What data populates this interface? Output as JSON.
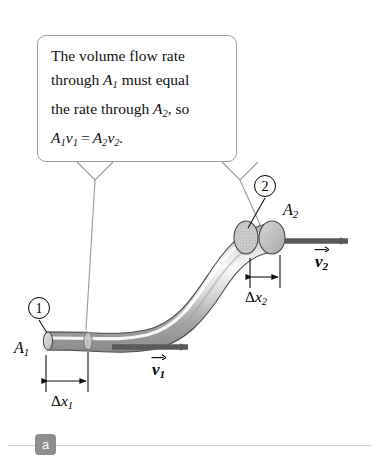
{
  "figure": {
    "panel_label": "a",
    "callout": {
      "line1_a": "The volume flow rate",
      "line2_a": "through ",
      "line2_sym": "A",
      "line2_sub": "1",
      "line2_b": " must equal",
      "line3_a": "the rate through ",
      "line3_sym": "A",
      "line3_sub": "2",
      "line3_b": ", so",
      "equation": {
        "lhs_A": "A",
        "lhs_A_sub": "1",
        "lhs_v": "v",
        "lhs_v_sub": "1",
        "operator": "=",
        "rhs_A": "A",
        "rhs_A_sub": "2",
        "rhs_v": "v",
        "rhs_v_sub": "2",
        "period": "."
      }
    },
    "markers": {
      "point1": "1",
      "point2": "2"
    },
    "labels": {
      "area1_sym": "A",
      "area1_sub": "1",
      "area2_sym": "A",
      "area2_sub": "2",
      "delta_x1_delta": "Δ",
      "delta_x1_x": "x",
      "delta_x1_sub": "1",
      "delta_x2_delta": "Δ",
      "delta_x2_x": "x",
      "delta_x2_sub": "2",
      "velocity1_sym": "v",
      "velocity1_sub": "1",
      "velocity2_sym": "v",
      "velocity2_sub": "2"
    },
    "colors": {
      "background": "#ffffff",
      "callout_border": "#9a9a9a",
      "tube_light": "#f2f2f2",
      "tube_mid": "#c8c8c8",
      "tube_dark": "#8d8d8d",
      "tube_outline": "#4a4a4a",
      "vector_arrow": "#5a5a5a",
      "dimension_line": "#111111",
      "badge_fill": "#8e8e8e",
      "rule": "#c9c9c9"
    }
  }
}
